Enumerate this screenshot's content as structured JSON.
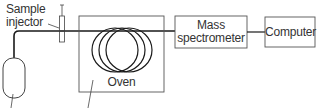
{
  "diagram": {
    "labels": {
      "sample_injector_line1": "Sample",
      "sample_injector_line2": "injector",
      "oven": "Oven",
      "mass_spec_line1": "Mass",
      "mass_spec_line2": "spectrometer",
      "computer": "Computer"
    },
    "colors": {
      "line": "#1a1a1a",
      "box_border": "#555555",
      "text": "#333333",
      "background": "#ffffff"
    }
  }
}
